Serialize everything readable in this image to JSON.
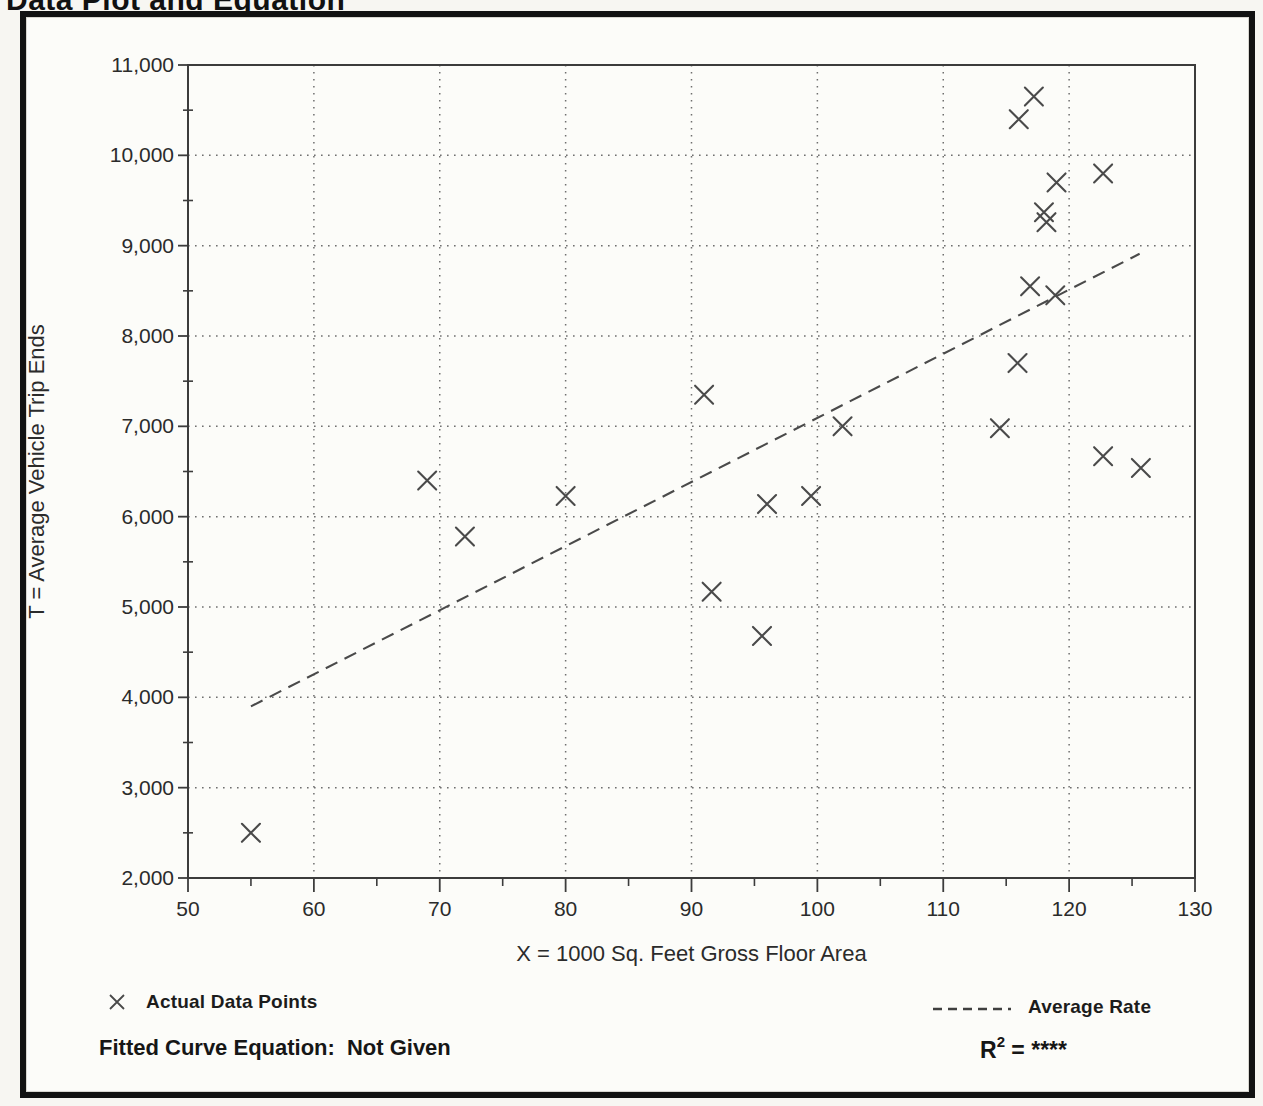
{
  "page_title": "Data Plot and Equation",
  "chart_data": {
    "type": "scatter",
    "title": "Data Plot and Equation",
    "xlabel": "X = 1000 Sq. Feet Gross Floor Area",
    "ylabel": "T = Average Vehicle Trip Ends",
    "xlim": [
      50,
      130
    ],
    "ylim": [
      2000,
      11000
    ],
    "x_major_step": 10,
    "x_minor_step": 5,
    "y_major_step": 1000,
    "y_minor_step": 500,
    "x_tick_labels": [
      "50",
      "60",
      "70",
      "80",
      "90",
      "100",
      "110",
      "120",
      "130"
    ],
    "y_tick_labels": [
      "2,000",
      "3,000",
      "4,000",
      "5,000",
      "6,000",
      "7,000",
      "8,000",
      "9,000",
      "10,000",
      "11,000"
    ],
    "grid": "dotted gridlines at every major tick, both axes",
    "legend_position": "below chart",
    "series": [
      {
        "name": "Actual Data Points",
        "marker": "x",
        "points": [
          [
            55.0,
            2500
          ],
          [
            69.0,
            6400
          ],
          [
            72.0,
            5780
          ],
          [
            80.0,
            6230
          ],
          [
            91.0,
            7350
          ],
          [
            91.6,
            5170
          ],
          [
            95.6,
            4680
          ],
          [
            96.0,
            6140
          ],
          [
            99.5,
            6230
          ],
          [
            102.0,
            7000
          ],
          [
            114.5,
            6980
          ],
          [
            115.9,
            7700
          ],
          [
            116.0,
            10400
          ],
          [
            116.9,
            8550
          ],
          [
            117.2,
            10650
          ],
          [
            118.0,
            9370
          ],
          [
            118.2,
            9260
          ],
          [
            118.9,
            8450
          ],
          [
            119.0,
            9700
          ],
          [
            122.7,
            6670
          ],
          [
            122.7,
            9800
          ],
          [
            125.7,
            6540
          ]
        ]
      }
    ],
    "trend_line": {
      "name": "Average Rate",
      "style": "dashed",
      "x_start": 55.0,
      "t_start": 3900,
      "x_end": 125.6,
      "t_end": 8910,
      "rate_per_unit": 70.9
    }
  },
  "legend": {
    "points_label": "Actual Data Points",
    "rate_label": "Average Rate"
  },
  "footer": {
    "equation_label": "Fitted Curve Equation:",
    "equation_value": "Not Given",
    "r_squared_base": "R",
    "r_squared_exp": "2",
    "r_squared_value": " = ****"
  }
}
